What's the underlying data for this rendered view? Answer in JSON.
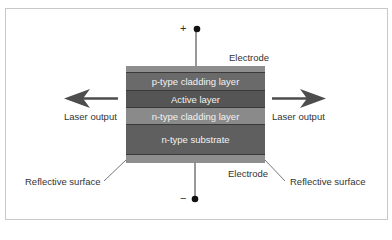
{
  "diagram": {
    "terminals": {
      "positive": "+",
      "negative": "−"
    },
    "electrode_labels": {
      "top": "Electrode",
      "bottom": "Electrode"
    },
    "layers": [
      {
        "id": "top-electrode",
        "label": "",
        "color": "#8e8e8e"
      },
      {
        "id": "p-type-cladding",
        "label": "p-type cladding layer",
        "color": "#6a6a6a"
      },
      {
        "id": "active",
        "label": "Active layer",
        "color": "#555555"
      },
      {
        "id": "n-type-cladding",
        "label": "n-type cladding layer",
        "color": "#8a8a8a"
      },
      {
        "id": "n-type-substrate",
        "label": "n-type substrate",
        "color": "#5f5f5f"
      },
      {
        "id": "bottom-electrode",
        "label": "",
        "color": "#8e8e8e"
      }
    ],
    "outputs": {
      "left": "Laser output",
      "right": "Laser output"
    },
    "reflective_surfaces": {
      "left": "Reflective surface",
      "right": "Reflective surface"
    },
    "colors": {
      "arrow": "#4d4d4d",
      "wire": "#333333",
      "frame": "#c8c8c8"
    }
  }
}
